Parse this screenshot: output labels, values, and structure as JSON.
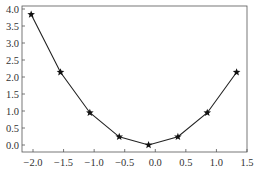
{
  "chart_data": {
    "type": "line",
    "title": "",
    "xlabel": "",
    "ylabel": "",
    "xlim": [
      -2.2,
      1.5
    ],
    "ylim": [
      -0.2,
      4.0
    ],
    "x_ticks": [
      -2.0,
      -1.5,
      -1.0,
      -0.5,
      0.0,
      0.5,
      1.0,
      1.5
    ],
    "x_tick_labels": [
      "-2.0",
      "-1.5",
      "-1.0",
      "-0.5",
      "0.0",
      "0.5",
      "1.0",
      "1.5"
    ],
    "y_ticks": [
      0.0,
      0.5,
      1.0,
      1.5,
      2.0,
      2.5,
      3.0,
      3.5,
      4.0
    ],
    "y_tick_labels": [
      "0.0",
      "0.5",
      "1.0",
      "1.5",
      "2.0",
      "2.5",
      "3.0",
      "3.5",
      "4.0"
    ],
    "grid": false,
    "legend": null,
    "series": [
      {
        "name": "series-1",
        "marker": "star",
        "color": "#222222",
        "x": [
          -2.03,
          -1.55,
          -1.07,
          -0.59,
          -0.11,
          0.37,
          0.85,
          1.33
        ],
        "y": [
          3.84,
          2.14,
          0.95,
          0.24,
          0.0,
          0.24,
          0.95,
          2.14
        ]
      }
    ]
  }
}
